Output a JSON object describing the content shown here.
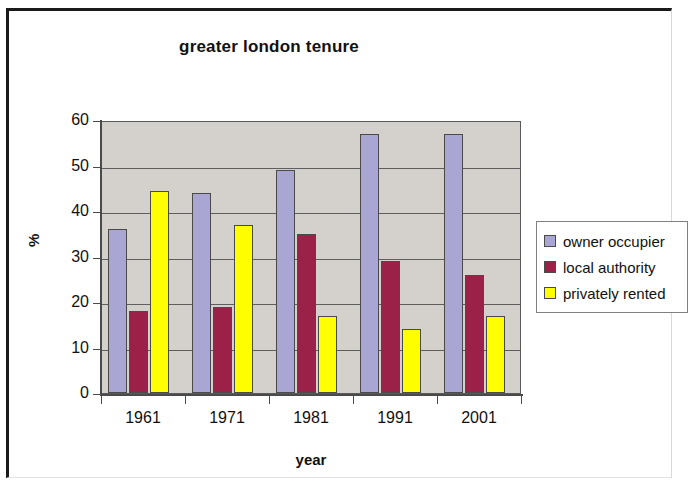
{
  "chart_data": {
    "type": "bar",
    "title": "greater london tenure",
    "xlabel": "year",
    "ylabel": "%",
    "categories": [
      "1961",
      "1971",
      "1981",
      "1991",
      "2001"
    ],
    "series": [
      {
        "name": "owner occupier",
        "color": "#a9a6d4",
        "values": [
          36,
          44,
          49,
          57,
          57
        ]
      },
      {
        "name": "local authority",
        "color": "#9b2148",
        "values": [
          18,
          19,
          35,
          29,
          26
        ]
      },
      {
        "name": "privately rented",
        "color": "#ffff00",
        "values": [
          44.5,
          37,
          17,
          14,
          17
        ]
      }
    ],
    "ylim": [
      0,
      60
    ],
    "y_ticks": [
      "60",
      "50",
      "40",
      "30",
      "20",
      "10",
      "0"
    ],
    "grid": true,
    "legend_position": "right",
    "plot_background": "#d4d0cb"
  }
}
